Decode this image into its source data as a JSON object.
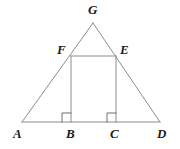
{
  "figure": {
    "canvas": {
      "width": 180,
      "height": 149,
      "background": "#ffffff"
    },
    "style": {
      "stroke_color": "#8c8c8c",
      "stroke_width": 1,
      "label_color": "#1a1a1a",
      "label_font_size": 13
    },
    "points": {
      "A": {
        "x": 22,
        "y": 122
      },
      "B": {
        "x": 71,
        "y": 122
      },
      "C": {
        "x": 116,
        "y": 122
      },
      "D": {
        "x": 160,
        "y": 122
      },
      "E": {
        "x": 116,
        "y": 56
      },
      "F": {
        "x": 71,
        "y": 56
      },
      "G": {
        "x": 93,
        "y": 23
      }
    },
    "segments": [
      {
        "name": "side-AG",
        "from": "A",
        "to": "G"
      },
      {
        "name": "side-GD",
        "from": "G",
        "to": "D"
      },
      {
        "name": "base-AD",
        "from": "A",
        "to": "D"
      },
      {
        "name": "rect-top-FE",
        "from": "F",
        "to": "E"
      },
      {
        "name": "rect-left-FB",
        "from": "F",
        "to": "B"
      },
      {
        "name": "rect-right-EC",
        "from": "E",
        "to": "C"
      }
    ],
    "right_angle_marks": [
      {
        "name": "right-angle-at-B",
        "vertex": "B",
        "size": 9,
        "side": "left"
      },
      {
        "name": "right-angle-at-C",
        "vertex": "C",
        "size": 9,
        "side": "left"
      }
    ],
    "labels": [
      {
        "id": "G",
        "text": "G",
        "x": 88,
        "y": 3
      },
      {
        "id": "F",
        "text": "F",
        "x": 57,
        "y": 43
      },
      {
        "id": "E",
        "text": "E",
        "x": 120,
        "y": 43
      },
      {
        "id": "A",
        "text": "A",
        "x": 13,
        "y": 127
      },
      {
        "id": "B",
        "text": "B",
        "x": 66,
        "y": 127
      },
      {
        "id": "C",
        "text": "C",
        "x": 110,
        "y": 127
      },
      {
        "id": "D",
        "text": "D",
        "x": 157,
        "y": 127
      }
    ]
  }
}
